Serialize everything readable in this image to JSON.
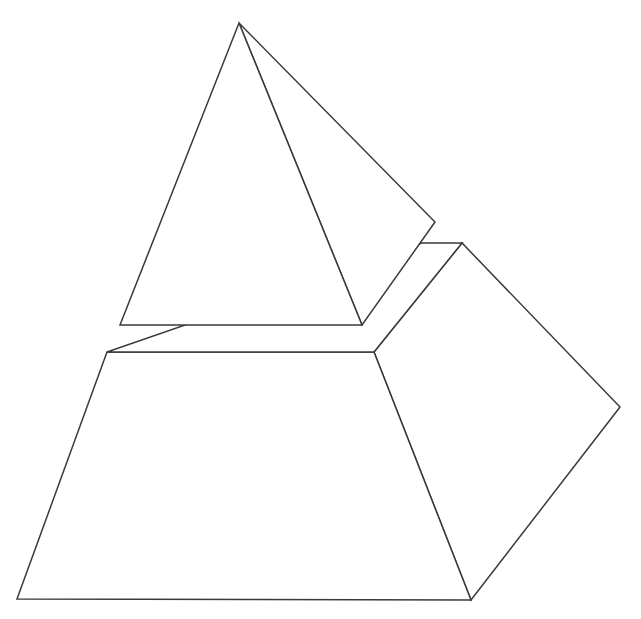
{
  "canvas": {
    "width": 641,
    "height": 619,
    "background_color": "#ffffff",
    "stroke_color": "#3a3a3a",
    "stroke_width": 1.5,
    "fill_color": "#ffffff"
  },
  "figure": {
    "style": "line-art",
    "parts": [
      {
        "id": "apex-cap",
        "name": "upper pyramid cap",
        "faces": [
          {
            "id": "cap-front-face",
            "name": "cap front triangular face",
            "points": "239,23 120,325 362,325"
          },
          {
            "id": "cap-right-face",
            "name": "cap right triangular face",
            "points": "239,23 435,222 362,325"
          }
        ]
      },
      {
        "id": "base-frustum",
        "name": "lower truncated pyramid base",
        "faces": [
          {
            "id": "frustum-front-face",
            "name": "frustum front trapezoidal face",
            "points": "107,352 374,352 471,600 17,599"
          },
          {
            "id": "frustum-right-face",
            "name": "frustum right trapezoidal face",
            "points": "374,352 462,243 620,407 471,600"
          },
          {
            "id": "frustum-top-face",
            "name": "frustum top quadrilateral face",
            "points": "107,352 374,352 462,243 422,243"
          }
        ]
      }
    ],
    "vertices": [
      {
        "name": "apex",
        "x": 239,
        "y": 23
      },
      {
        "name": "cap-base-left",
        "x": 120,
        "y": 325
      },
      {
        "name": "cap-base-front",
        "x": 362,
        "y": 325
      },
      {
        "name": "cap-base-right",
        "x": 435,
        "y": 222
      },
      {
        "name": "frustum-top-back-left",
        "x": 422,
        "y": 243
      },
      {
        "name": "frustum-top-back-right",
        "x": 462,
        "y": 243
      },
      {
        "name": "frustum-top-left",
        "x": 107,
        "y": 352
      },
      {
        "name": "frustum-top-front",
        "x": 374,
        "y": 352
      },
      {
        "name": "frustum-bottom-left",
        "x": 17,
        "y": 599
      },
      {
        "name": "frustum-bottom-front",
        "x": 471,
        "y": 600
      },
      {
        "name": "frustum-bottom-right",
        "x": 620,
        "y": 407
      }
    ]
  }
}
